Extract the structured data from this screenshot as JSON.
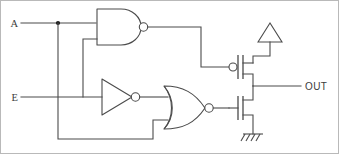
{
  "figure": {
    "background_color": "#ffffff",
    "line_color": "#4b4b4b",
    "border_color": "#b9b9b9"
  },
  "labels": {
    "input_a": "A",
    "input_e": "E",
    "output": "OUT"
  },
  "inputs": [
    {
      "name": "A",
      "label": "A",
      "y": 22
    },
    {
      "name": "E",
      "label": "E",
      "y": 96
    }
  ],
  "outputs": [
    {
      "name": "OUT",
      "label": "OUT",
      "y": 85
    }
  ],
  "gates": [
    {
      "id": "nand1",
      "type": "NAND",
      "inputs": [
        "A",
        "E"
      ],
      "output": "pmos_gate"
    },
    {
      "id": "inv1",
      "type": "NOT",
      "inputs": [
        "E"
      ],
      "output": "nor_in_top"
    },
    {
      "id": "nor1",
      "type": "NOR",
      "inputs": [
        "inv1_out",
        "A"
      ],
      "output": "nmos_gate"
    }
  ],
  "transistors": [
    {
      "id": "mp1",
      "type": "PMOS",
      "gate_from": "nand1",
      "source": "VDD",
      "drain": "OUT",
      "has_gate_bubble": true
    },
    {
      "id": "mn1",
      "type": "NMOS",
      "gate_from": "nor1",
      "source": "GND",
      "drain": "OUT",
      "has_gate_bubble": false
    }
  ],
  "power": {
    "vdd_symbol": "triangle-up",
    "gnd_symbol": "hatched-ground"
  },
  "nodes": {
    "junction_a": {
      "x": 57,
      "y": 22
    }
  }
}
